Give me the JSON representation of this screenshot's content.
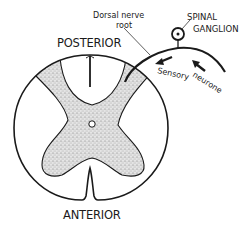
{
  "diagram": {
    "labels": {
      "posterior": "POSTERIOR",
      "anterior": "ANTERIOR",
      "dorsal_root_line1": "Dorsal nerve",
      "dorsal_root_line2": "root",
      "ganglion_line1": "SPINAL",
      "ganglion_line2": "GANGLION",
      "sensory": "Sensory",
      "neurone": "neurone"
    },
    "colors": {
      "stroke": "#1a1a1a",
      "gray_matter_fill": "#d9d9d9",
      "background": "#ffffff"
    },
    "components": [
      "spinal-cord-outline",
      "gray-matter",
      "central-canal",
      "posterior-median-groove",
      "anterior-median-fissure",
      "dorsal-nerve-root",
      "spinal-ganglion",
      "sensory-neurone-arrows"
    ]
  }
}
